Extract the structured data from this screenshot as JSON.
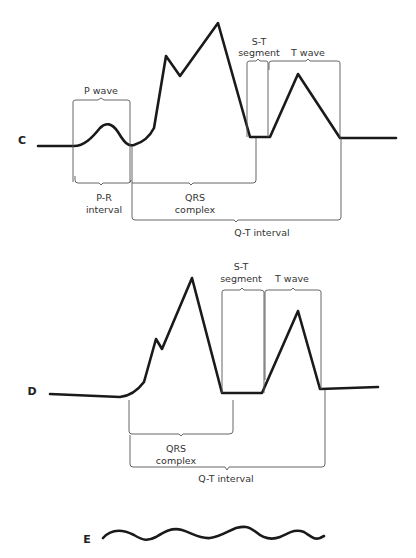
{
  "diagrams": {
    "C": {
      "letter": "C",
      "labels": {
        "p_wave": "P wave",
        "st_segment_line1": "S-T",
        "st_segment_line2": "segment",
        "t_wave": "T wave",
        "pr_interval_line1": "P-R",
        "pr_interval_line2": "interval",
        "qrs_line1": "QRS",
        "qrs_line2": "complex",
        "qt_interval": "Q-T interval"
      }
    },
    "D": {
      "letter": "D",
      "labels": {
        "st_segment_line1": "S-T",
        "st_segment_line2": "segment",
        "t_wave": "T wave",
        "qrs_line1": "QRS",
        "qrs_line2": "complex",
        "qt_interval": "Q-T interval"
      }
    },
    "E": {
      "letter": "E"
    }
  },
  "colors": {
    "trace": "#1a1a1a",
    "bracket": "#555555",
    "text": "#333333",
    "background": "#ffffff"
  }
}
